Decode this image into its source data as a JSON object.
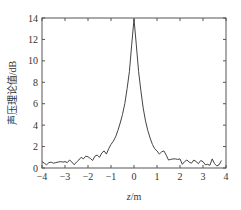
{
  "chart_data": {
    "type": "line",
    "title": "",
    "xlabel": "z/m",
    "xlabel_italic_part": "z",
    "xlabel_unit_part": "/m",
    "ylabel": "声压理论值/dB",
    "xlim": [
      -4,
      4
    ],
    "ylim": [
      0,
      14
    ],
    "xticks": [
      -4,
      -3,
      -2,
      -1,
      0,
      1,
      2,
      3,
      4
    ],
    "yticks": [
      0,
      2,
      4,
      6,
      8,
      10,
      12,
      14
    ],
    "xtick_labels": [
      "−4",
      "−3",
      "−2",
      "−1",
      "0",
      "1",
      "2",
      "3",
      "4"
    ],
    "ytick_labels": [
      "0",
      "2",
      "4",
      "6",
      "8",
      "10",
      "12",
      "14"
    ],
    "grid": false,
    "legend": null,
    "series": [
      {
        "name": "声压理论值",
        "color": "#444444",
        "x": [
          -4.0,
          -3.9,
          -3.8,
          -3.7,
          -3.6,
          -3.5,
          -3.4,
          -3.3,
          -3.2,
          -3.1,
          -3.0,
          -2.9,
          -2.8,
          -2.7,
          -2.6,
          -2.5,
          -2.4,
          -2.3,
          -2.2,
          -2.1,
          -2.0,
          -1.9,
          -1.8,
          -1.7,
          -1.6,
          -1.5,
          -1.4,
          -1.3,
          -1.2,
          -1.1,
          -1.0,
          -0.9,
          -0.8,
          -0.7,
          -0.6,
          -0.5,
          -0.4,
          -0.3,
          -0.2,
          -0.1,
          0.0,
          0.1,
          0.2,
          0.3,
          0.4,
          0.5,
          0.6,
          0.7,
          0.8,
          0.9,
          1.0,
          1.1,
          1.2,
          1.3,
          1.4,
          1.5,
          1.6,
          1.7,
          1.8,
          1.9,
          2.0,
          2.1,
          2.2,
          2.3,
          2.4,
          2.5,
          2.6,
          2.7,
          2.8,
          2.9,
          3.0,
          3.1,
          3.2,
          3.3,
          3.4,
          3.5,
          3.6,
          3.7,
          3.8
        ],
        "y": [
          0.6,
          0.45,
          0.3,
          0.5,
          0.55,
          0.45,
          0.5,
          0.55,
          0.6,
          0.55,
          0.6,
          0.5,
          0.75,
          0.55,
          0.3,
          0.55,
          0.75,
          1.0,
          0.85,
          1.1,
          1.05,
          0.9,
          0.7,
          1.1,
          1.2,
          1.0,
          1.4,
          1.6,
          1.3,
          1.8,
          2.2,
          2.5,
          2.9,
          3.5,
          4.2,
          5.0,
          6.0,
          7.4,
          9.0,
          11.5,
          13.9,
          11.5,
          9.0,
          7.2,
          5.6,
          4.4,
          3.5,
          2.8,
          2.2,
          1.8,
          1.6,
          1.3,
          1.5,
          1.6,
          1.2,
          0.75,
          0.8,
          0.85,
          0.85,
          0.8,
          0.85,
          0.35,
          0.6,
          0.75,
          0.55,
          0.45,
          0.75,
          0.6,
          0.4,
          0.7,
          0.6,
          0.3,
          0.35,
          0.25,
          0.85,
          0.4,
          0.2,
          0.3,
          0.7
        ]
      }
    ]
  }
}
